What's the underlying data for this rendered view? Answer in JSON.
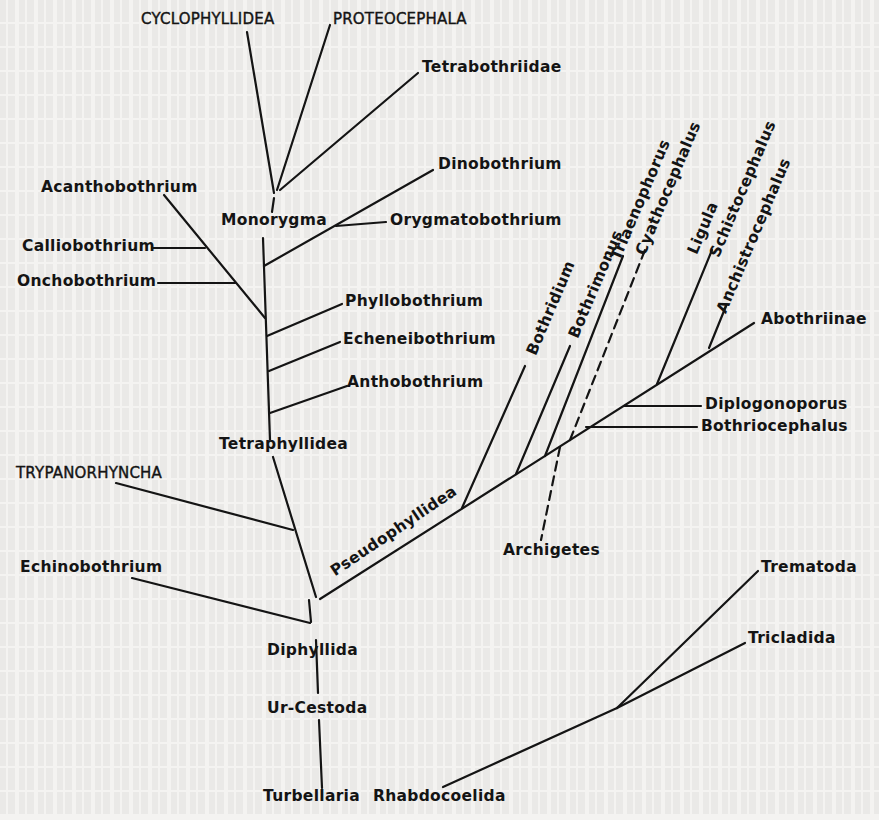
{
  "figure": {
    "type": "phylogenetic-tree",
    "title": "",
    "background_color": "#f4f3f1",
    "line_color": "#141414"
  },
  "labels": {
    "cyclophyllidea": "CYCLOPHYLLIDEA",
    "proteocephala": "PROTEOCEPHALA",
    "tetrabothriidae": "Tetrabothriidae",
    "dinobothrium": "Dinobothrium",
    "acanthobothrium": "Acanthobothrium",
    "monorygma": "Monorygma",
    "orygmatobothrium": "Orygmatobothrium",
    "calliobothrium": "Calliobothrium",
    "onchobothrium": "Onchobothrium",
    "phyllobothrium": "Phyllobothrium",
    "echeneibothrium": "Echeneibothrium",
    "anthobothrium": "Anthobothrium",
    "tetraphyllidea": "Tetraphyllidea",
    "trypanorhyncha": "TRYPANORHYNCHA",
    "echinobothrium": "Echinobothrium",
    "diphyllida": "Diphyllida",
    "ur_cestoda": "Ur-Cestoda",
    "turbellaria": "Turbellaria",
    "rhabdocoelida": "Rhabdocoelida",
    "pseudophyllidea": "Pseudophyllidea",
    "bothridium": "Bothridium",
    "bothrimonus": "Bothrimonus",
    "triaenophorus": "Triaenophorus",
    "cyathocephalus": "Cyathocephalus",
    "ligula": "Ligula",
    "schistocephalus": "Schistocephalus",
    "anchistrocephalus": "Anchistrocephalus",
    "abothriinae": "Abothriinae",
    "diplogonoporus": "Diplogonoporus",
    "bothriocephalus": "Bothriocephalus",
    "archigetes": "Archigetes",
    "trematoda": "Trematoda",
    "tricladida": "Tricladida"
  },
  "tree": {
    "root": "Turbellaria",
    "edges": [
      [
        "Turbellaria",
        "Ur-Cestoda"
      ],
      [
        "Turbellaria",
        "Rhabdocoelida"
      ],
      [
        "Rhabdocoelida",
        "Trematoda"
      ],
      [
        "Rhabdocoelida",
        "Tricladida"
      ],
      [
        "Ur-Cestoda",
        "Diphyllida"
      ],
      [
        "Diphyllida",
        "Echinobothrium"
      ],
      [
        "Diphyllida",
        "Pseudophyllidea"
      ],
      [
        "Diphyllida",
        "TRYPANORHYNCHA"
      ],
      [
        "Diphyllida",
        "Tetraphyllidea"
      ],
      [
        "Tetraphyllidea",
        "Anthobothrium"
      ],
      [
        "Tetraphyllidea",
        "Echeneibothrium"
      ],
      [
        "Tetraphyllidea",
        "Phyllobothrium"
      ],
      [
        "Tetraphyllidea",
        "Acanthobothrium"
      ],
      [
        "Acanthobothrium",
        "Onchobothrium"
      ],
      [
        "Acanthobothrium",
        "Calliobothrium"
      ],
      [
        "Tetraphyllidea",
        "Dinobothrium"
      ],
      [
        "Dinobothrium",
        "Orygmatobothrium"
      ],
      [
        "Tetraphyllidea",
        "Monorygma"
      ],
      [
        "Monorygma",
        "CYCLOPHYLLIDEA"
      ],
      [
        "Monorygma",
        "PROTEOCEPHALA"
      ],
      [
        "Monorygma",
        "Tetrabothriidae"
      ],
      [
        "Pseudophyllidea",
        "Bothridium"
      ],
      [
        "Pseudophyllidea",
        "Bothrimonus"
      ],
      [
        "Pseudophyllidea",
        "Triaenophorus"
      ],
      [
        "Pseudophyllidea",
        "Cyathocephalus",
        "dashed"
      ],
      [
        "Pseudophyllidea",
        "Archigetes",
        "dashed"
      ],
      [
        "Pseudophyllidea",
        "Bothriocephalus"
      ],
      [
        "Pseudophyllidea",
        "Diplogonoporus"
      ],
      [
        "Pseudophyllidea",
        "Ligula"
      ],
      [
        "Ligula",
        "Schistocephalus"
      ],
      [
        "Pseudophyllidea",
        "Anchistrocephalus"
      ],
      [
        "Pseudophyllidea",
        "Abothriinae"
      ]
    ]
  }
}
